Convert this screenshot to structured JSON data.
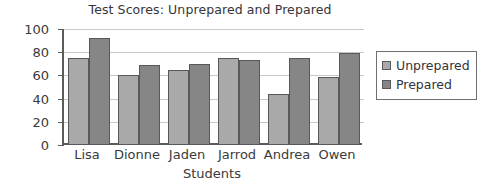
{
  "chart_data": {
    "type": "bar",
    "title": "Test Scores: Unprepared and Prepared",
    "xlabel": "Students",
    "ylabel": "Percentage",
    "categories": [
      "Lisa",
      "Dionne",
      "Jaden",
      "Jarrod",
      "Andrea",
      "Owen"
    ],
    "series": [
      {
        "name": "Unprepared",
        "color": "#a9a9a9",
        "values": [
          75,
          60,
          65,
          75,
          44,
          59
        ]
      },
      {
        "name": "Prepared",
        "color": "#868686",
        "values": [
          92,
          69,
          70,
          73,
          75,
          79
        ]
      }
    ],
    "ylim": [
      0,
      100
    ],
    "yticks": [
      0,
      20,
      40,
      60,
      80,
      100
    ],
    "ytick_labels": [
      "0",
      "20",
      "40",
      "60",
      "80",
      "100"
    ],
    "grid": true,
    "grid_axis": "y",
    "legend_position": "right",
    "legend_entries": [
      "Unprepared",
      "Prepared"
    ]
  }
}
